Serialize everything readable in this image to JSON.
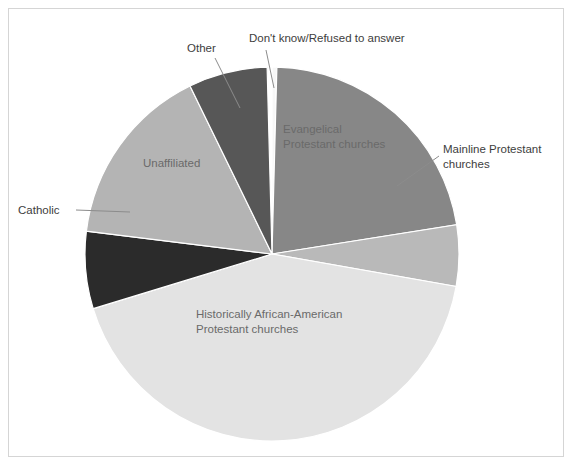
{
  "figure": {
    "background_color": "#ffffff",
    "border_color": "#d5d5d5",
    "width": 574,
    "height": 467
  },
  "chart_data": {
    "type": "pie",
    "title": "",
    "subtitle": "",
    "xlabel": "",
    "ylabel": "",
    "legend_position": "none",
    "grid": false,
    "labels_placement": "mixed-inside-and-callout",
    "start_angle_deg": 0,
    "direction": "clockwise",
    "center": {
      "x": 272,
      "y": 254
    },
    "radius": 187,
    "categories": [
      "Don't know/Refused to answer",
      "Evangelical Protestant churches",
      "Mainline Protestant churches",
      "Historically African-American Protestant churches",
      "Catholic",
      "Unaffiliated",
      "Other"
    ],
    "values": [
      0.4,
      22,
      5,
      42.6,
      7,
      16,
      7
    ],
    "slices": [
      {
        "label": "Don't know/Refused to answer",
        "value": 0.4,
        "color": "#f7f7f7",
        "start_deg": 0,
        "end_deg": 1.5,
        "label_type": "callout",
        "label_x": 249,
        "label_y": 42,
        "label_anchor": "start",
        "leader": {
          "x1": 266,
          "y1": 50,
          "x2": 274,
          "y2": 88
        }
      },
      {
        "label_lines": [
          "Evangelical",
          "Protestant churches"
        ],
        "label": "Evangelical Protestant churches",
        "value": 22,
        "color": "#878787",
        "start_deg": 1.5,
        "end_deg": 81,
        "label_type": "inside",
        "label_x": 283,
        "label_y": 133,
        "label_anchor": "start"
      },
      {
        "label_lines": [
          "Mainline Protestant",
          "churches"
        ],
        "label": "Mainline Protestant churches",
        "value": 5,
        "color": "#b9b9b9",
        "start_deg": 81,
        "end_deg": 100,
        "label_type": "callout",
        "label_x": 443,
        "label_y": 153,
        "label_anchor": "start",
        "leader": {
          "x1": 439,
          "y1": 156,
          "x2": 397,
          "y2": 186
        }
      },
      {
        "label_lines": [
          "Historically African-American",
          "Protestant churches"
        ],
        "label": "Historically African-American Protestant churches",
        "value": 42.6,
        "color": "#e3e3e3",
        "start_deg": 100,
        "end_deg": 253,
        "label_type": "inside",
        "label_x": 196,
        "label_y": 318,
        "label_anchor": "start"
      },
      {
        "label": "Catholic",
        "value": 7,
        "color": "#2b2b2b",
        "start_deg": 253,
        "end_deg": 277,
        "label_type": "callout",
        "label_x": 18,
        "label_y": 214,
        "label_anchor": "start",
        "leader": {
          "x1": 76,
          "y1": 210,
          "x2": 130,
          "y2": 212
        }
      },
      {
        "label": "Unaffiliated",
        "value": 16,
        "color": "#b4b4b4",
        "start_deg": 277,
        "end_deg": 334,
        "label_type": "inside",
        "label_x": 143,
        "label_y": 167,
        "label_anchor": "start"
      },
      {
        "label": "Other",
        "value": 7,
        "color": "#575757",
        "start_deg": 334,
        "end_deg": 358.5,
        "label_type": "callout",
        "label_x": 187,
        "label_y": 52,
        "label_anchor": "start",
        "leader": {
          "x1": 215,
          "y1": 58,
          "x2": 240,
          "y2": 108
        }
      }
    ]
  }
}
